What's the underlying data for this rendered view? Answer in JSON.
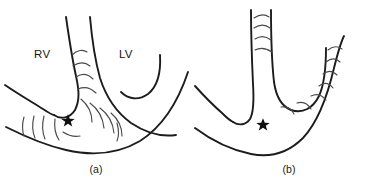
{
  "figure": {
    "background_color": "#ffffff",
    "line_color": "#1c1c1c",
    "hatch_color": "#4a4a4a",
    "marker_color": "#101010",
    "width": 385,
    "height": 190
  },
  "panels": [
    {
      "id": "a",
      "caption": "(a)",
      "labels": [
        {
          "name": "right-ventricle",
          "text": "RV"
        },
        {
          "name": "left-ventricle",
          "text": "LV"
        }
      ],
      "marker": {
        "name": "star-marker",
        "glyph": "★",
        "x": 68,
        "y": 121
      },
      "hatch_regions": [
        "septum",
        "apical-inferoseptal",
        "rv-free-wall-apex"
      ],
      "hatch_count": 14
    },
    {
      "id": "b",
      "caption": "(b)",
      "labels": [],
      "marker": {
        "name": "star-marker",
        "glyph": "★",
        "x": 70,
        "y": 125
      },
      "hatch_regions": [
        "septum",
        "lv-lateral-wall"
      ],
      "hatch_count": 11
    }
  ]
}
